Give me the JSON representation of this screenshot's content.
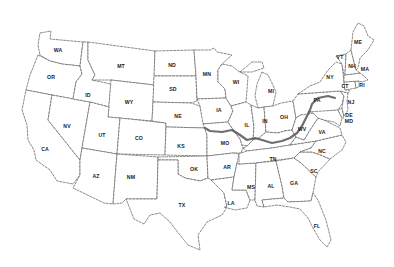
{
  "map": {
    "title": "",
    "states": [
      {
        "abbr": "WA",
        "x": 58,
        "y": 51
      },
      {
        "abbr": "OR",
        "x": 51,
        "y": 78
      },
      {
        "abbr": "CA",
        "x": 45,
        "y": 150
      },
      {
        "abbr": "NV",
        "x": 67,
        "y": 127
      },
      {
        "abbr": "ID",
        "x": 88,
        "y": 96
      },
      {
        "abbr": "MT",
        "x": 121,
        "y": 67
      },
      {
        "abbr": "WY",
        "x": 129,
        "y": 103
      },
      {
        "abbr": "UT",
        "x": 102,
        "y": 136
      },
      {
        "abbr": "CO",
        "x": 139,
        "y": 139
      },
      {
        "abbr": "AZ",
        "x": 96,
        "y": 177
      },
      {
        "abbr": "NM",
        "x": 131,
        "y": 178
      },
      {
        "abbr": "ND",
        "x": 172,
        "y": 66
      },
      {
        "abbr": "SD",
        "x": 173,
        "y": 90
      },
      {
        "abbr": "NE",
        "x": 178,
        "y": 117
      },
      {
        "abbr": "KS",
        "x": 181,
        "y": 147
      },
      {
        "abbr": "OK",
        "x": 194,
        "y": 170
      },
      {
        "abbr": "TX",
        "x": 182,
        "y": 206
      },
      {
        "abbr": "MN",
        "x": 207,
        "y": 75
      },
      {
        "abbr": "IA",
        "x": 219,
        "y": 111
      },
      {
        "abbr": "MO",
        "x": 225,
        "y": 144
      },
      {
        "abbr": "AR",
        "x": 227,
        "y": 168
      },
      {
        "abbr": "LA",
        "x": 231,
        "y": 204
      },
      {
        "abbr": "WI",
        "x": 236,
        "y": 83
      },
      {
        "abbr": "IL",
        "x": 247,
        "y": 126
      },
      {
        "abbr": "MS",
        "x": 251,
        "y": 188
      },
      {
        "abbr": "MI",
        "x": 271,
        "y": 92
      },
      {
        "abbr": "IN",
        "x": 265,
        "y": 122
      },
      {
        "abbr": "OH",
        "x": 284,
        "y": 118
      },
      {
        "abbr": "TN",
        "x": 273,
        "y": 160
      },
      {
        "abbr": "AL",
        "x": 271,
        "y": 187
      },
      {
        "abbr": "GA",
        "x": 294,
        "y": 184
      },
      {
        "abbr": "WV",
        "x": 302,
        "y": 130
      },
      {
        "abbr": "VA",
        "x": 322,
        "y": 133
      },
      {
        "abbr": "NC",
        "x": 322,
        "y": 152
      },
      {
        "abbr": "SC",
        "x": 314,
        "y": 172
      },
      {
        "abbr": "FL",
        "x": 317,
        "y": 227
      },
      {
        "abbr": "PA",
        "x": 317,
        "y": 101
      },
      {
        "abbr": "NY",
        "x": 330,
        "y": 78
      },
      {
        "abbr": "NJ",
        "x": 351,
        "y": 103
      },
      {
        "abbr": "DE",
        "x": 349,
        "y": 116
      },
      {
        "abbr": "MD",
        "x": 349,
        "y": 122
      },
      {
        "abbr": "CT",
        "x": 345,
        "y": 87
      },
      {
        "abbr": "RI",
        "x": 362,
        "y": 86
      },
      {
        "abbr": "MA",
        "x": 365,
        "y": 70
      },
      {
        "abbr": "VT",
        "x": 340,
        "y": 58
      },
      {
        "abbr": "NH",
        "x": 352,
        "y": 67
      },
      {
        "abbr": "ME",
        "x": 358,
        "y": 43
      }
    ],
    "highlighted_route": {
      "description": "Thick line along KS/MO border, Missouri River, Ohio River, through WV/VA into PA",
      "color": "#555555"
    }
  }
}
